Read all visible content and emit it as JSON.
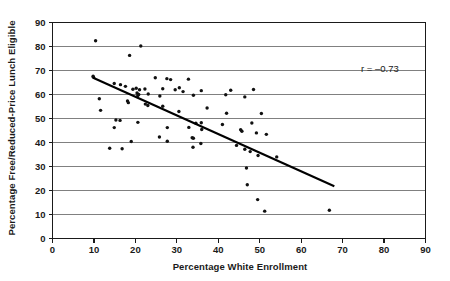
{
  "chart_data": {
    "type": "scatter",
    "title": "",
    "subtitle": "",
    "xlabel": "Percentage White Enrollment",
    "ylabel": "Percentage Free/Reduced-Price Lunch Eligible",
    "xlim": [
      0,
      90
    ],
    "ylim": [
      0,
      90
    ],
    "xticks": [
      0,
      10,
      20,
      30,
      40,
      50,
      60,
      70,
      80,
      90
    ],
    "yticks": [
      0,
      10,
      20,
      30,
      40,
      50,
      60,
      70,
      80,
      90
    ],
    "xtick_labels": [
      "0",
      "10",
      "20",
      "30",
      "40",
      "50",
      "60",
      "70",
      "80",
      "90"
    ],
    "ytick_labels": [
      "0",
      "10",
      "20",
      "30",
      "40",
      "50",
      "60",
      "70",
      "80",
      "90"
    ],
    "grid": "horizontal",
    "legend": "none",
    "annotations": [
      {
        "name": "correlation-annotation",
        "text": "r = –0.73",
        "x": 79,
        "y": 69.5
      }
    ],
    "series": [
      {
        "name": "schools",
        "marker": "dot",
        "color": "#111111",
        "points": [
          [
            10.4,
            82.4
          ],
          [
            21.3,
            80.2
          ],
          [
            18.6,
            76.3
          ],
          [
            9.8,
            67.6
          ],
          [
            9.9,
            67.2
          ],
          [
            24.8,
            67.0
          ],
          [
            27.6,
            66.6
          ],
          [
            28.5,
            66.2
          ],
          [
            32.8,
            66.4
          ],
          [
            14.9,
            64.6
          ],
          [
            16.4,
            64.1
          ],
          [
            17.6,
            63.4
          ],
          [
            19.4,
            62.2
          ],
          [
            20.2,
            62.6
          ],
          [
            21.0,
            62.0
          ],
          [
            22.3,
            62.3
          ],
          [
            26.6,
            62.4
          ],
          [
            29.6,
            62.0
          ],
          [
            30.6,
            62.8
          ],
          [
            31.5,
            61.2
          ],
          [
            35.9,
            61.6
          ],
          [
            43.0,
            61.8
          ],
          [
            48.5,
            62.1
          ],
          [
            20.4,
            60.6
          ],
          [
            20.6,
            59.6
          ],
          [
            20.8,
            60.0
          ],
          [
            23.1,
            60.2
          ],
          [
            25.9,
            59.4
          ],
          [
            34.0,
            59.7
          ],
          [
            41.8,
            59.9
          ],
          [
            46.4,
            59.0
          ],
          [
            11.3,
            58.2
          ],
          [
            18.1,
            57.3
          ],
          [
            18.3,
            56.6
          ],
          [
            22.4,
            56.0
          ],
          [
            23.0,
            55.4
          ],
          [
            26.6,
            55.1
          ],
          [
            37.3,
            54.4
          ],
          [
            11.6,
            53.4
          ],
          [
            30.5,
            52.9
          ],
          [
            42.0,
            52.2
          ],
          [
            50.4,
            52.1
          ],
          [
            15.3,
            49.4
          ],
          [
            16.3,
            49.2
          ],
          [
            20.6,
            48.4
          ],
          [
            34.6,
            48.0
          ],
          [
            35.9,
            48.2
          ],
          [
            41.0,
            47.5
          ],
          [
            48.1,
            48.1
          ],
          [
            14.9,
            46.2
          ],
          [
            27.7,
            46.2
          ],
          [
            32.9,
            46.3
          ],
          [
            36.0,
            45.4
          ],
          [
            45.4,
            45.3
          ],
          [
            45.7,
            44.7
          ],
          [
            49.2,
            44.0
          ],
          [
            51.6,
            43.4
          ],
          [
            19.0,
            40.4
          ],
          [
            25.8,
            42.3
          ],
          [
            27.7,
            40.5
          ],
          [
            33.7,
            42.0
          ],
          [
            34.0,
            41.8
          ],
          [
            13.8,
            37.6
          ],
          [
            16.8,
            37.4
          ],
          [
            33.9,
            38.0
          ],
          [
            35.8,
            39.6
          ],
          [
            44.4,
            38.8
          ],
          [
            46.4,
            37.2
          ],
          [
            47.7,
            36.2
          ],
          [
            49.6,
            34.6
          ],
          [
            54.1,
            34.0
          ],
          [
            46.8,
            29.4
          ],
          [
            47.0,
            22.4
          ],
          [
            49.5,
            16.2
          ],
          [
            51.2,
            11.4
          ],
          [
            66.8,
            11.8
          ]
        ]
      }
    ],
    "trendline": {
      "name": "regression-line",
      "x_start": 9.8,
      "y_start": 67.0,
      "x_end": 68.0,
      "y_end": 21.8,
      "color": "#000000"
    }
  }
}
